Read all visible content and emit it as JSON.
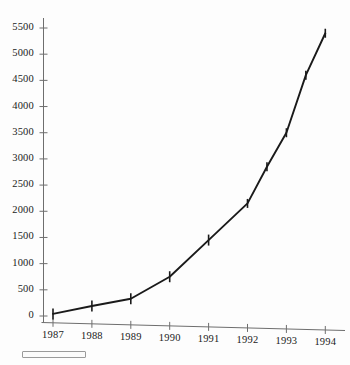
{
  "chart_data": {
    "type": "line",
    "title": "",
    "subtitle": "",
    "xlabel": "",
    "ylabel": "",
    "xlim": [
      1986.6,
      1994.6
    ],
    "ylim": [
      0,
      5750
    ],
    "grid": false,
    "legend": null,
    "marker": "vertical-error-bar",
    "line_color": "#1a1a1a",
    "axis_color": "#6e6e6e",
    "x_tick_labels": [
      "1987",
      "1988",
      "1989",
      "1990",
      "1991",
      "1992",
      "1993",
      "1994"
    ],
    "y_tick_labels": [
      "0",
      "500",
      "1000",
      "1500",
      "2000",
      "2500",
      "3000",
      "3500",
      "4000",
      "4500",
      "5000",
      "5500"
    ],
    "y_ticks": [
      0,
      500,
      1000,
      1500,
      2000,
      2500,
      3000,
      3500,
      4000,
      4500,
      5000,
      5500
    ],
    "x_ticks": [
      1987,
      1988,
      1989,
      1990,
      1991,
      1992,
      1993,
      1994
    ],
    "series": [
      {
        "name": "series-1",
        "x": [
          1987,
          1988,
          1989,
          1990,
          1991,
          1992,
          1992.5,
          1993,
          1993.5,
          1994
        ],
        "values": [
          40,
          190,
          330,
          750,
          1450,
          2150,
          2850,
          3500,
          4600,
          5400
        ]
      }
    ]
  },
  "annotations": {
    "scale_bar_label": ""
  }
}
